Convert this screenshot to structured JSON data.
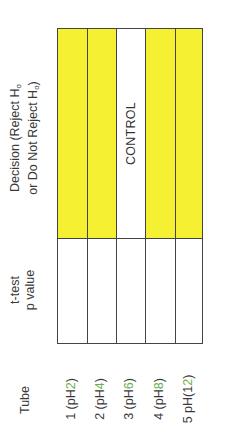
{
  "table": {
    "headers": {
      "tube": "Tube",
      "ttest_line1": "t-test",
      "ttest_line2": "p value",
      "decision_line1": "Decision (Reject H",
      "decision_line2": "or Do Not Reject H",
      "decision_line2_close": ")",
      "subscript": "o"
    },
    "rows": [
      {
        "tube_prefix": "1 (pH",
        "tube_num": "2",
        "tube_suffix": ")",
        "p_value": "",
        "decision": "",
        "decision_color": "#f5f032"
      },
      {
        "tube_prefix": "2 (pH",
        "tube_num": "4",
        "tube_suffix": ")",
        "p_value": "",
        "decision": "",
        "decision_color": "#f5f032"
      },
      {
        "tube_prefix": "3 (pH",
        "tube_num": "6",
        "tube_suffix": ")",
        "p_value": "",
        "decision": "CONTROL",
        "decision_color": "#ffffff"
      },
      {
        "tube_prefix": "4 (pH",
        "tube_num": "8",
        "tube_suffix": ")",
        "p_value": "",
        "decision": "",
        "decision_color": "#f5f032"
      },
      {
        "tube_prefix": "5 pH(1",
        "tube_num": "2",
        "tube_suffix": ")",
        "p_value": "",
        "decision": "",
        "decision_color": "#f5f032"
      }
    ]
  },
  "colors": {
    "highlight": "#f5f032",
    "border": "#444444",
    "text": "#333333"
  }
}
